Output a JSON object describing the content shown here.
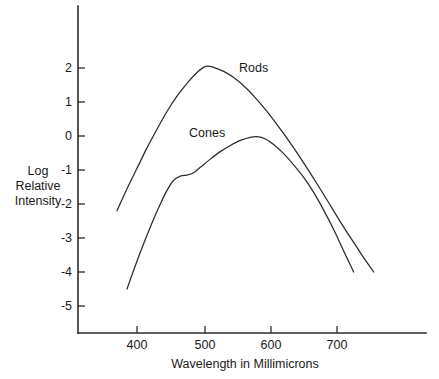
{
  "chart_data": {
    "type": "line",
    "title": "",
    "xlabel": "Wavelength in Millimicrons",
    "ylabel": "Log Relative Intensity",
    "ylabel_lines": [
      "Log",
      "Relative",
      "Intensity"
    ],
    "xlim": [
      345,
      765
    ],
    "ylim": [
      -5.8,
      2.75
    ],
    "grid": false,
    "legend_position": "inline-annotation",
    "xticks": [
      400,
      500,
      600,
      700
    ],
    "xtick_labels": [
      "400",
      "500",
      "600",
      "700"
    ],
    "yticks": [
      2,
      1,
      0,
      -1,
      -2,
      -3,
      -4,
      -5
    ],
    "ytick_labels": [
      "2",
      "1",
      "0",
      "-1",
      "-2",
      "-3",
      "-4",
      "-5"
    ],
    "series": [
      {
        "name": "Rods",
        "label": "Rods",
        "label_x": 560,
        "label_y": 1.78,
        "color": "#2b2b2b",
        "x": [
          370,
          385,
          400,
          415,
          430,
          445,
          460,
          475,
          490,
          503,
          515,
          530,
          545,
          560,
          575,
          590,
          605,
          620,
          635,
          650,
          665,
          680,
          695,
          710,
          725,
          740,
          755
        ],
        "y": [
          -2.2,
          -1.55,
          -0.95,
          -0.35,
          0.2,
          0.72,
          1.17,
          1.55,
          1.87,
          2.05,
          2.02,
          1.9,
          1.72,
          1.48,
          1.18,
          0.84,
          0.47,
          0.07,
          -0.35,
          -0.79,
          -1.25,
          -1.72,
          -2.2,
          -2.68,
          -3.13,
          -3.58,
          -4.0
        ]
      },
      {
        "name": "Cones",
        "label": "Cones",
        "label_x": 510,
        "label_y": -0.02,
        "color": "#2b2b2b",
        "x": [
          385,
          395,
          405,
          415,
          425,
          435,
          445,
          455,
          465,
          475,
          485,
          495,
          510,
          525,
          540,
          555,
          570,
          580,
          592,
          605,
          620,
          635,
          650,
          665,
          680,
          695,
          710,
          725
        ],
        "y": [
          -4.5,
          -3.95,
          -3.42,
          -2.92,
          -2.44,
          -2.0,
          -1.6,
          -1.3,
          -1.18,
          -1.15,
          -1.08,
          -0.92,
          -0.68,
          -0.46,
          -0.28,
          -0.13,
          -0.04,
          -0.02,
          -0.08,
          -0.25,
          -0.52,
          -0.85,
          -1.22,
          -1.66,
          -2.18,
          -2.75,
          -3.38,
          -4.0
        ]
      }
    ]
  },
  "axes": {
    "x_title": "Wavelength in Millimicrons",
    "y_title_line1": "Log",
    "y_title_line2": "Relative",
    "y_title_line3": "Intensity"
  }
}
